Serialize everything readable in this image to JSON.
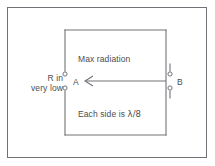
{
  "figure": {
    "background_color": "#ffffff",
    "line_color": "#6f7377",
    "text_color": "#4a4d50"
  },
  "frame": {
    "border_color": "#6f7377"
  },
  "labels": {
    "max_radiation": "Max radiation",
    "each_side_prefix": "Each side is ",
    "each_side_lambda": "λ/8",
    "r_in_line1": "R in",
    "r_in_line2": "very low",
    "terminal_a": "A",
    "terminal_b": "B"
  },
  "diagram": {
    "loop": {
      "left": 65,
      "top": 30,
      "right": 166,
      "bottom": 135,
      "gap_top": 74,
      "gap_bottom": 88
    },
    "terminals": [
      {
        "name": "terminal-a-upper",
        "cx": 65,
        "cy": 74
      },
      {
        "name": "terminal-a-lower",
        "cx": 65,
        "cy": 88
      },
      {
        "name": "terminal-b-upper",
        "cx": 170,
        "cy": 74
      },
      {
        "name": "terminal-b-lower",
        "cx": 170,
        "cy": 88
      }
    ],
    "arrow": {
      "name": "max-radiation-arrow",
      "from_x": 166,
      "to_x": 84,
      "y": 81,
      "direction": "left"
    }
  }
}
